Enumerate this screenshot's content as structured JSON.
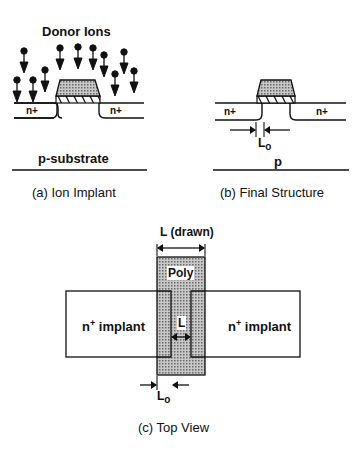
{
  "panel_a": {
    "title": "Donor Ions",
    "left_region": "n+",
    "right_region": "n+",
    "substrate": "p-substrate",
    "caption": "(a) Ion Implant"
  },
  "panel_b": {
    "left_region": "n+",
    "right_region": "n+",
    "overlap_label": "L",
    "overlap_sub": "o",
    "substrate": "p",
    "caption": "(b) Final Structure"
  },
  "panel_c": {
    "drawn_label": "L (drawn)",
    "poly_label": "Poly",
    "left_implant": "n",
    "left_implant_sup": "+",
    "left_implant_rest": " implant",
    "right_implant": "n",
    "right_implant_sup": "+",
    "right_implant_rest": " implant",
    "channel_label": "L",
    "overlap_label": "L",
    "overlap_sub": "o",
    "caption": "(c) Top View"
  },
  "colors": {
    "ink": "#111111",
    "poly_fill": "#a8a8a8",
    "background": "#ffffff"
  }
}
